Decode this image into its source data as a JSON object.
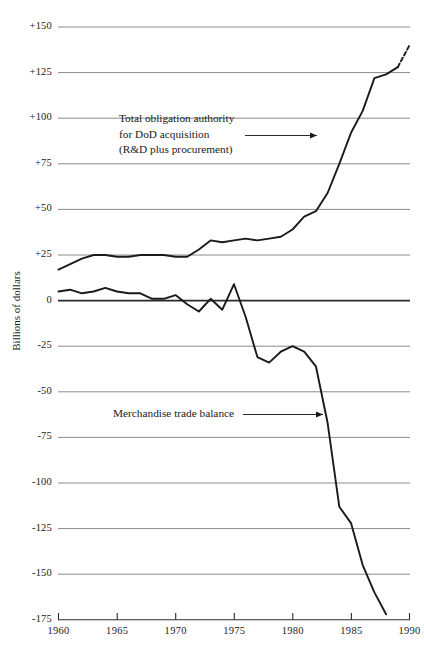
{
  "chart_data": {
    "type": "line",
    "title": "",
    "xlabel": "",
    "ylabel": "Billions of dollars",
    "xlim": [
      1960,
      1990
    ],
    "ylim": [
      -175,
      150
    ],
    "grid": true,
    "legend_position": "none",
    "y_ticks": [
      "+150",
      "+125",
      "+100",
      "+75",
      "+50",
      "+25",
      "0",
      "-25",
      "-50",
      "-75",
      "-100",
      "-125",
      "-150",
      "-175"
    ],
    "y_tick_values": [
      150,
      125,
      100,
      75,
      50,
      25,
      0,
      -25,
      -50,
      -75,
      -100,
      -125,
      -150,
      -175
    ],
    "x_ticks": [
      "1960",
      "1965",
      "1970",
      "1975",
      "1980",
      "1985",
      "1990"
    ],
    "x_tick_values": [
      1960,
      1965,
      1970,
      1975,
      1980,
      1985,
      1990
    ],
    "series": [
      {
        "name": "Total obligation authority for DoD acquisition (R&D plus procurement)",
        "x": [
          1960,
          1961,
          1962,
          1963,
          1964,
          1965,
          1966,
          1967,
          1968,
          1969,
          1970,
          1971,
          1972,
          1973,
          1974,
          1975,
          1976,
          1977,
          1978,
          1979,
          1980,
          1981,
          1982,
          1983,
          1984,
          1985,
          1986,
          1987,
          1988,
          1989
        ],
        "values": [
          17,
          20,
          23,
          25,
          25,
          24,
          24,
          25,
          25,
          25,
          24,
          24,
          28,
          33,
          32,
          33,
          34,
          33,
          34,
          35,
          39,
          46,
          49,
          59,
          75,
          92,
          104,
          122,
          124,
          128
        ],
        "style": "solid",
        "projection_x": [
          1989,
          1990
        ],
        "projection_values": [
          128,
          140
        ]
      },
      {
        "name": "Merchandise trade balance",
        "x": [
          1960,
          1961,
          1962,
          1963,
          1964,
          1965,
          1966,
          1967,
          1968,
          1969,
          1970,
          1971,
          1972,
          1973,
          1974,
          1975,
          1976,
          1977,
          1978,
          1979,
          1980,
          1981,
          1982,
          1983,
          1984,
          1985,
          1986,
          1987,
          1988
        ],
        "values": [
          5,
          6,
          4,
          5,
          7,
          5,
          4,
          4,
          1,
          1,
          3,
          -2,
          -6,
          1,
          -5,
          9,
          -9,
          -31,
          -34,
          -28,
          -25,
          -28,
          -36,
          -67,
          -113,
          -122,
          -145,
          -160,
          -172
        ],
        "style": "solid"
      }
    ],
    "annotations": [
      {
        "id": "dod-annotation",
        "lines": [
          "Total obligation authority",
          "for DoD acquisition",
          "(R&D plus procurement)"
        ],
        "arrow": "right"
      },
      {
        "id": "trade-annotation",
        "lines": [
          "Merchandise trade balance"
        ],
        "arrow": "right"
      }
    ],
    "colors": {
      "line": "#1a1a1a",
      "grid": "#8b8b8b",
      "axis": "#2b2b2b",
      "background": "#ffffff"
    }
  },
  "axis": {
    "y_title": "Billions of dollars",
    "y_labels": {
      "t0": "+150",
      "t1": "+125",
      "t2": "+100",
      "t3": "+75",
      "t4": "+50",
      "t5": "+25",
      "t6": "0",
      "t7": "-25",
      "t8": "-50",
      "t9": "-75",
      "t10": "-100",
      "t11": "-125",
      "t12": "-150",
      "t13": "-175"
    },
    "x_labels": {
      "t0": "1960",
      "t1": "1965",
      "t2": "1970",
      "t3": "1975",
      "t4": "1980",
      "t5": "1985",
      "t6": "1990"
    }
  },
  "annotations": {
    "dod": {
      "line1": "Total obligation authority",
      "line2": "for DoD acquisition",
      "line3": "(R&D plus procurement)"
    },
    "trade": {
      "line1": "Merchandise trade balance"
    }
  },
  "page_trim": {
    "top_cut_text": ""
  }
}
